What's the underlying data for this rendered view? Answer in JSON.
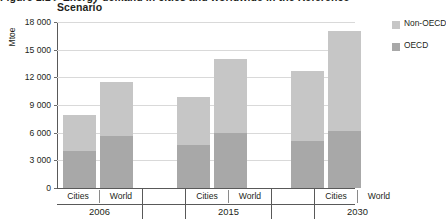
{
  "caption": {
    "line1_clipped": "Figure 1.1 ▸ Energy demand in cities and worldwide in the Reference",
    "line2": "Scenario"
  },
  "chart_data": {
    "type": "bar",
    "stacked": true,
    "title": "Scenario",
    "xlabel": "",
    "ylabel": "Mtoe",
    "ylim": [
      0,
      18000
    ],
    "yticks": [
      "0",
      "3 000",
      "6 000",
      "9 000",
      "12 000",
      "15 000",
      "18 000"
    ],
    "ytick_values": [
      0,
      3000,
      6000,
      9000,
      12000,
      15000,
      18000
    ],
    "grid": true,
    "legend_position": "right",
    "categories": [
      "Cities",
      "World",
      "Cities",
      "World",
      "Cities",
      "World"
    ],
    "groups": [
      {
        "label": "2006",
        "categories": [
          "Cities",
          "World"
        ]
      },
      {
        "label": "2015",
        "categories": [
          "Cities",
          "World"
        ]
      },
      {
        "label": "2030",
        "categories": [
          "Cities",
          "World"
        ]
      }
    ],
    "series": [
      {
        "name": "OECD",
        "color": "#a8a8a8",
        "values": [
          4000,
          5650,
          4650,
          6000,
          5100,
          6200
        ]
      },
      {
        "name": "Non-OECD",
        "color": "#c6c6c6",
        "values": [
          3900,
          5850,
          5250,
          8000,
          7600,
          10800
        ]
      }
    ],
    "totals": [
      7900,
      11500,
      9900,
      14000,
      12700,
      17000
    ],
    "bars": [
      {
        "group": "2006",
        "category": "Cities",
        "oecd": 4000,
        "non_oecd": 3900,
        "total": 7900
      },
      {
        "group": "2006",
        "category": "World",
        "oecd": 5650,
        "non_oecd": 5850,
        "total": 11500
      },
      {
        "group": "2015",
        "category": "Cities",
        "oecd": 4650,
        "non_oecd": 5250,
        "total": 9900
      },
      {
        "group": "2015",
        "category": "World",
        "oecd": 6000,
        "non_oecd": 8000,
        "total": 14000
      },
      {
        "group": "2030",
        "category": "Cities",
        "oecd": 5100,
        "non_oecd": 7600,
        "total": 12700
      },
      {
        "group": "2030",
        "category": "World",
        "oecd": 6200,
        "non_oecd": 10800,
        "total": 17000
      }
    ],
    "legend": [
      {
        "label": "Non-OECD",
        "color": "#c6c6c6"
      },
      {
        "label": "OECD",
        "color": "#a8a8a8"
      }
    ]
  },
  "colors": {
    "non_oecd": "#c6c6c6",
    "oecd": "#a8a8a8",
    "grid": "#d9d9d9",
    "axis": "#595959",
    "text": "#231f20"
  }
}
